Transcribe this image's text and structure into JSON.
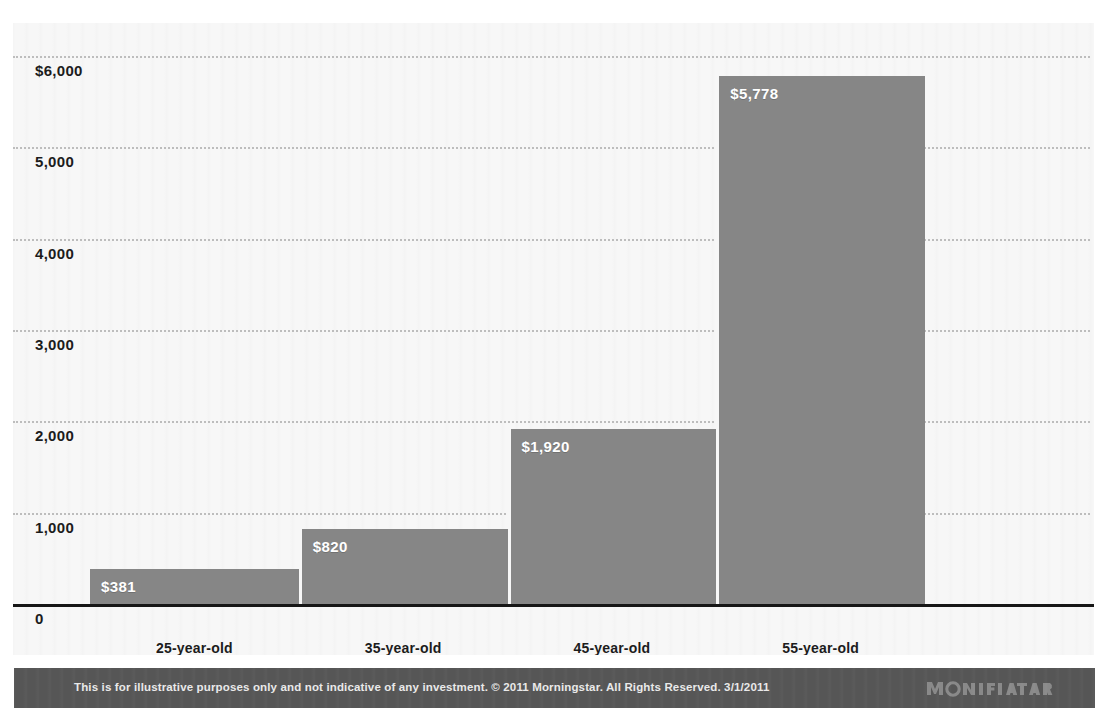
{
  "chart_data": {
    "type": "bar",
    "title": "",
    "subtitle": "",
    "xlabel": "",
    "ylabel": "",
    "categories": [
      "25-year-old",
      "35-year-old",
      "45-year-old",
      "55-year-old"
    ],
    "values": [
      381,
      820,
      1920,
      5778
    ],
    "value_labels": [
      "$381",
      "$820",
      "$1,920",
      "$5,778"
    ],
    "ylim": [
      0,
      6000
    ],
    "yticks": [
      0,
      1000,
      2000,
      3000,
      4000,
      5000,
      6000
    ],
    "ytick_labels": [
      "0",
      "1,000",
      "2,000",
      "3,000",
      "4,000",
      "5,000",
      "$6,000"
    ],
    "grid": true,
    "grid_style": "dotted",
    "legend": "none",
    "series": [
      {
        "name": "Monthly savings required",
        "values": [
          381,
          820,
          1920,
          5778
        ]
      }
    ]
  },
  "colors": {
    "bar": "#868686",
    "plot_background": "#f7f7f7",
    "page_background": "#ffffff",
    "gridline": "#bdbdbd",
    "axis_line": "#161616",
    "footer_band": "#565656",
    "footer_text": "#e9e9e9",
    "bar_label_text": "#ffffff",
    "tick_text": "#1c1c1c"
  },
  "footer": {
    "disclaimer": "This is for illustrative purposes only and not indicative of any investment. © 2011 Morningstar. All Rights Reserved. 3/1/2011",
    "logo_text": "MORNINGSTAR",
    "logo_icon": "morningstar-logo"
  }
}
